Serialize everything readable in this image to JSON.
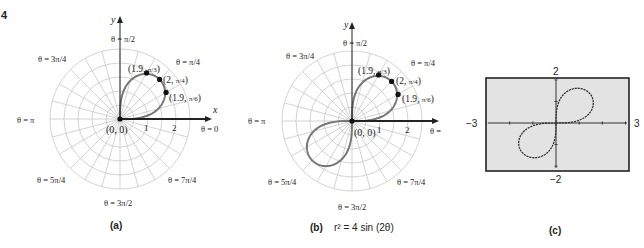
{
  "figure_number": "4",
  "panels": {
    "a": {
      "caption": "(a)",
      "axis_x": "x",
      "axis_y": "y",
      "origin_label": "(0, 0)",
      "ticks": [
        "1",
        "2"
      ],
      "angle_labels": {
        "pi_over_2": "θ = π/2",
        "pi_over_4": "θ = π/4",
        "three_pi_over_4": "θ = 3π/4",
        "pi": "θ = π",
        "zero": "θ = 0",
        "five_pi_over_4": "θ = 5π/4",
        "seven_pi_over_4": "θ = 7π/4",
        "three_pi_over_2": "θ = 3π/2"
      },
      "points": [
        {
          "label": "(1.9, π/3)",
          "r": 1.9,
          "theta": "π/3"
        },
        {
          "label": "(2, π/4)",
          "r": 2,
          "theta": "π/4"
        },
        {
          "label": "(1.9, π/6)",
          "r": 1.9,
          "theta": "π/6"
        }
      ]
    },
    "b": {
      "caption": "(b)",
      "equation": "r² = 4 sin (2θ)",
      "axis_x": "x",
      "axis_y": "y",
      "origin_label": "(0, 0)",
      "ticks": [
        "1",
        "2"
      ],
      "points": [
        {
          "label": "(1.9, π/3)",
          "r": 1.9,
          "theta": "π/3"
        },
        {
          "label": "(2, π/4)",
          "r": 2,
          "theta": "π/4"
        },
        {
          "label": "(1.9, π/6)",
          "r": 1.9,
          "theta": "π/6"
        }
      ]
    },
    "c": {
      "caption": "(c)",
      "xmin": "−3",
      "xmax": "3",
      "ymin": "−2",
      "ymax": "2"
    }
  },
  "chart_data": [
    {
      "type": "line",
      "title": "(a) Lemniscate r² = 4 sin(2θ), 0 ≤ θ ≤ π/2",
      "coordinate_system": "polar",
      "points": [
        {
          "r": 0,
          "theta": 0
        },
        {
          "r": 1.9,
          "theta": 0.5236
        },
        {
          "r": 2,
          "theta": 0.7854
        },
        {
          "r": 1.9,
          "theta": 1.0472
        },
        {
          "r": 0,
          "theta": 1.5708
        }
      ],
      "rlim": [
        0,
        2.5
      ]
    },
    {
      "type": "line",
      "title": "(b) r² = 4 sin(2θ)",
      "coordinate_system": "polar",
      "equation": "r^2 = 4 sin(2θ)",
      "rlim": [
        0,
        2.5
      ]
    },
    {
      "type": "line",
      "title": "(c) Graphing calculator view",
      "xlim": [
        -3,
        3
      ],
      "ylim": [
        -2,
        2
      ],
      "equation": "r^2 = 4 sin(2θ)"
    }
  ]
}
